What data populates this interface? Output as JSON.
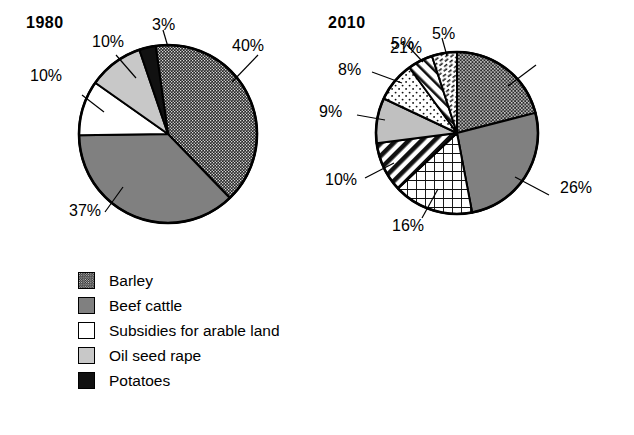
{
  "chart_data": [
    {
      "type": "pie",
      "title": "1980",
      "categories": [
        "Barley",
        "Beef cattle",
        "Subsidies for arable land",
        "Oil seed rape",
        "Potatoes"
      ],
      "values": [
        40,
        37,
        10,
        10,
        3
      ],
      "labels": [
        "40%",
        "37%",
        "10%",
        "10%",
        "3%"
      ],
      "patterns": [
        "fine-checker-dark",
        "solid-mid-gray",
        "solid-white",
        "solid-light-gray",
        "solid-black"
      ],
      "colors": [
        "#2b2b2b",
        "#808080",
        "#ffffff",
        "#c8c8c8",
        "#111111"
      ],
      "legend_position": "below",
      "start_angle_deg": -8,
      "direction": "clockwise"
    },
    {
      "type": "pie",
      "title": "2010",
      "categories": [
        "Barley",
        "Beef cattle",
        "Holiday cottage income",
        "Environment protection grants",
        "Income from B&B",
        "Farm woodland grant",
        "Subsidy for livestock"
      ],
      "values": [
        21,
        26,
        16,
        10,
        9,
        8,
        5
      ],
      "labels": [
        "21%",
        "26%",
        "16%",
        "10%",
        "9%",
        "8%",
        "5%"
      ],
      "extra_labels": [
        "5%"
      ],
      "patterns": [
        "fine-checker-dark",
        "solid-mid-gray",
        "grid-lines",
        "diagonal-stripe-back",
        "solid-light-gray",
        "dotted-sparse",
        "diagonal-stripe-fwd"
      ],
      "colors": [
        "#2b2b2b",
        "#808080",
        "#ffffff",
        "#ffffff",
        "#c0c0c0",
        "#ffffff",
        "#ffffff"
      ],
      "legend_position": "below",
      "start_angle_deg": 0,
      "direction": "clockwise"
    }
  ],
  "panel_1980": {
    "title": "1980",
    "pie": {
      "cx": 168,
      "cy": 134,
      "r": 89,
      "slices": [
        {
          "name": "barley",
          "label": "40%",
          "value": 40,
          "fill": "#2b2b2b",
          "pattern": "p-checker"
        },
        {
          "name": "beef",
          "label": "37%",
          "value": 37,
          "fill": "#808080",
          "pattern": "none"
        },
        {
          "name": "subsidies",
          "label": "10%",
          "value": 10,
          "fill": "#ffffff",
          "pattern": "none"
        },
        {
          "name": "oilseed",
          "label": "10%",
          "value": 10,
          "fill": "#c8c8c8",
          "pattern": "none"
        },
        {
          "name": "potatoes",
          "label": "3%",
          "value": 3,
          "fill": "#111111",
          "pattern": "none"
        }
      ]
    },
    "pct_labels": [
      {
        "text": "3%",
        "x": 152,
        "y": 17
      },
      {
        "text": "40%",
        "x": 232,
        "y": 38
      },
      {
        "text": "10%",
        "x": 92,
        "y": 34
      },
      {
        "text": "10%",
        "x": 30,
        "y": 68
      },
      {
        "text": "37%",
        "x": 69,
        "y": 203
      }
    ],
    "legend": [
      {
        "label": "Barley",
        "swatch": "checker"
      },
      {
        "label": "Beef cattle",
        "swatch": "midgray"
      },
      {
        "label": "Subsidies for arable land",
        "swatch": "white"
      },
      {
        "label": "Oil seed rape",
        "swatch": "lightgray"
      },
      {
        "label": "Potatoes",
        "swatch": "black"
      }
    ]
  },
  "panel_2010": {
    "title": "2010",
    "pie": {
      "cx": 140,
      "cy": 133,
      "r": 81,
      "slices": [
        {
          "name": "barley",
          "label": "21%",
          "value": 21,
          "fill": "#2b2b2b",
          "pattern": "p-checker2"
        },
        {
          "name": "beef",
          "label": "26%",
          "value": 26,
          "fill": "#808080",
          "pattern": "none"
        },
        {
          "name": "holiday",
          "label": "16%",
          "value": 16,
          "fill": "#ffffff",
          "pattern": "p-grid"
        },
        {
          "name": "environment",
          "label": "10%",
          "value": 10,
          "fill": "#ffffff",
          "pattern": "p-stripeback"
        },
        {
          "name": "bandb",
          "label": "9%",
          "value": 9,
          "fill": "#c0c0c0",
          "pattern": "none"
        },
        {
          "name": "woodland",
          "label": "8%",
          "value": 8,
          "fill": "#ffffff",
          "pattern": "p-dots"
        },
        {
          "name": "livestock",
          "label": "5%",
          "value": 5,
          "fill": "#ffffff",
          "pattern": "p-stripefwd"
        },
        {
          "name": "dashes",
          "label": "5%",
          "value": 5,
          "fill": "#ffffff",
          "pattern": "p-dashes"
        }
      ]
    },
    "pct_labels": [
      {
        "text": "21%",
        "x": 390,
        "y": 40
      },
      {
        "text": "26%",
        "x": 560,
        "y": 180
      },
      {
        "text": "16%",
        "x": 392,
        "y": 218
      },
      {
        "text": "10%",
        "x": 325,
        "y": 172
      },
      {
        "text": "9%",
        "x": 319,
        "y": 104
      },
      {
        "text": "8%",
        "x": 338,
        "y": 62
      },
      {
        "text": "5%",
        "x": 391,
        "y": 36
      },
      {
        "text": "5%",
        "x": 432,
        "y": 26
      }
    ],
    "legend": [
      {
        "label": "Barley",
        "swatch": "checker"
      },
      {
        "label": "Beef cattle",
        "swatch": "midgray"
      },
      {
        "label": "Holiday cottage income",
        "swatch": "grid"
      },
      {
        "label": "Environment protection grants",
        "swatch": "stripeback"
      },
      {
        "label": "Income from B&B",
        "swatch": "lightgray"
      },
      {
        "label": "Farm woodland grant",
        "swatch": "dots"
      },
      {
        "label": "Subsidy for livestock",
        "swatch": "stripefwd"
      }
    ]
  }
}
